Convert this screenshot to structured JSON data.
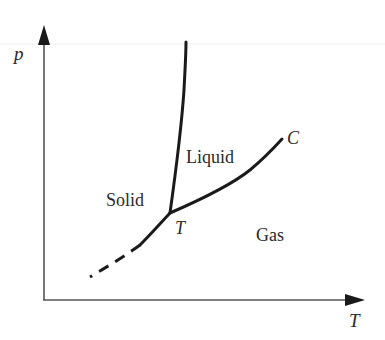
{
  "diagram": {
    "type": "phase-diagram",
    "axes": {
      "y_label": "p",
      "x_label": "T"
    },
    "regions": {
      "liquid": "Liquid",
      "solid": "Solid",
      "gas": "Gas"
    },
    "points": {
      "triple": "T",
      "critical": "C"
    },
    "curves": [
      {
        "name": "melting-curve",
        "from": "triple-point",
        "to": "top",
        "style": "solid"
      },
      {
        "name": "vaporization-curve",
        "from": "triple-point",
        "to": "critical-point",
        "style": "solid"
      },
      {
        "name": "sublimation-curve",
        "from": "triple-point",
        "to": "lower-left",
        "style": "solid-then-dashed"
      }
    ],
    "colors": {
      "line": "#1a1a1a",
      "axis": "#555555",
      "text": "#2a2a2a",
      "background": "#ffffff"
    }
  }
}
